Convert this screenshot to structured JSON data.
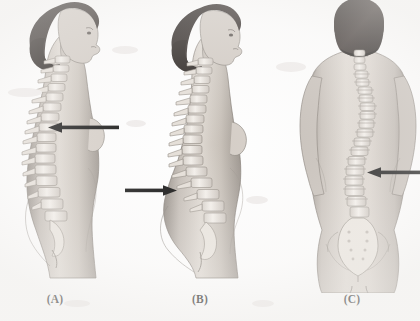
{
  "figure": {
    "canvas_width": 420,
    "canvas_height": 321,
    "background_color": "#fefefe",
    "style": "grayscale medical illustration",
    "ink_color": "#111111",
    "skin_color": "#cfc9c4",
    "bone_color": "#ebe7e2",
    "hair_color": "#241d1a"
  },
  "panels": [
    {
      "id": "panel-a",
      "caption": "(A)",
      "caption_x": 55,
      "view": "lateral-left-profile",
      "condition": "kyphosis",
      "arrow": {
        "direction": "left",
        "tail_x": 118,
        "tip_x": 48,
        "y": 127
      }
    },
    {
      "id": "panel-b",
      "caption": "(B)",
      "caption_x": 200,
      "view": "lateral-left-profile",
      "condition": "lordosis",
      "arrow": {
        "direction": "right",
        "tail_x": 127,
        "tip_x": 177,
        "y": 190
      }
    },
    {
      "id": "panel-c",
      "caption": "(C)",
      "caption_x": 352,
      "view": "posterior",
      "condition": "scoliosis",
      "arrow": {
        "direction": "left",
        "tail_x": 420,
        "tip_x": 367,
        "y": 172
      }
    }
  ],
  "captions": {
    "a": "(A)",
    "b": "(B)",
    "c": "(C)"
  },
  "caption_baseline_y": 300
}
